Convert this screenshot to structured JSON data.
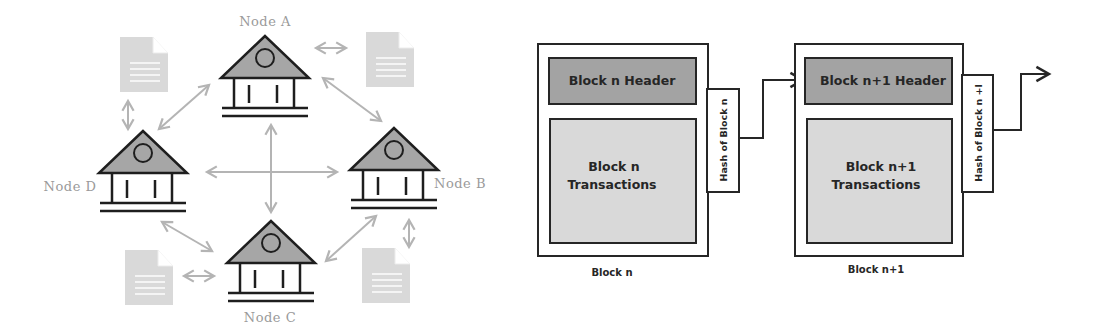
{
  "network": {
    "title": "Distributed ledger network",
    "nodes": [
      {
        "id": "A",
        "label": "Node A"
      },
      {
        "id": "B",
        "label": "Node B"
      },
      {
        "id": "C",
        "label": "Node C"
      },
      {
        "id": "D",
        "label": "Node D"
      }
    ],
    "icons": {
      "node": "bank-building-icon",
      "ledger": "document-icon",
      "link": "double-arrow-icon"
    },
    "colors": {
      "roof_fill": "#a6a6a6",
      "outline": "#1e1e1e",
      "arrow": "#b4b4b4",
      "document": "#d9d9d9",
      "label": "#9a9a9a"
    }
  },
  "blockchain": {
    "blocks": [
      {
        "header": "Block n Header",
        "transactions_line1": "Block n",
        "transactions_line2": "Transactions",
        "hash": "Hash of Block n",
        "caption": "Block n"
      },
      {
        "header": "Block n+1 Header",
        "transactions_line1": "Block n+1",
        "transactions_line2": "Transactions",
        "hash": "Hash of Block n +l",
        "caption": "Block n+1"
      }
    ],
    "colors": {
      "header_fill": "#a3a3a3",
      "transactions_fill": "#d9d9d9",
      "outline": "#262626"
    }
  }
}
